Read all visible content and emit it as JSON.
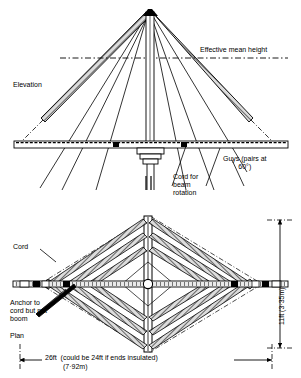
{
  "figure": {
    "type": "engineering-drawing"
  },
  "elevation": {
    "view_label": "Elevation",
    "effective_mean_height_label": "Effective mean height",
    "guys_label": "Guys (pairs at\n60°)",
    "cord_rotation_label": "Cord for\nbeam\nrotation"
  },
  "plan": {
    "view_label": "Plan",
    "cord_label": "Cord",
    "anchor_label": "Anchor to\ncord but not\nboom"
  },
  "dimensions": {
    "width_imperial": "26ft  (could be 24ft if ends insulated)",
    "width_metric": "(7·92m)",
    "height_combined": "11ft (3·35m)"
  },
  "colors": {
    "ink": "#000000",
    "paper": "#ffffff",
    "boom_fill": "#d8d8d8"
  }
}
